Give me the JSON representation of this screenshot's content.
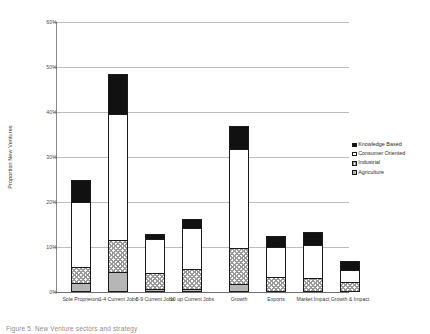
{
  "chart_data": {
    "type": "bar",
    "subtype": "stacked-column",
    "title": "",
    "xlabel": "",
    "ylabel": "Proportion New Ventures",
    "ylim": [
      0,
      60
    ],
    "ytick_labels": [
      "0%",
      "10%",
      "20%",
      "30%",
      "40%",
      "50%",
      "60%"
    ],
    "ytick_values": [
      0,
      10,
      20,
      30,
      40,
      50,
      60
    ],
    "grid": true,
    "legend_position": "right",
    "categories": [
      "Sole Proprietors",
      "1-4 Current Jobs",
      "5-9 Current Jobs",
      "10 up Current Jobs",
      "Growth",
      "Exports",
      "Market Impact",
      "Growth & Impact"
    ],
    "series": [
      {
        "name": "Agriculture",
        "key": "agriculture",
        "values": [
          2.0,
          4.5,
          0.6,
          0.6,
          1.8,
          0.0,
          0.0,
          0.0
        ]
      },
      {
        "name": "Industrial",
        "key": "industrial",
        "values": [
          3.5,
          7.0,
          3.7,
          4.5,
          8.0,
          3.4,
          3.2,
          2.2
        ]
      },
      {
        "name": "Consumer Oriented",
        "key": "consumer",
        "values": [
          14.5,
          28.0,
          7.5,
          9.2,
          22.0,
          6.6,
          7.2,
          2.6
        ]
      },
      {
        "name": "Knowledge Based",
        "key": "knowledge",
        "values": [
          5.0,
          9.0,
          1.0,
          2.0,
          5.0,
          2.4,
          3.0,
          2.0
        ]
      }
    ],
    "totals": [
      25.0,
      48.5,
      12.8,
      16.3,
      36.8,
      12.4,
      13.4,
      6.8
    ]
  },
  "legend": {
    "items": [
      {
        "label": "Knowledge Based",
        "key": "knowledge"
      },
      {
        "label": "Consumer Oriented",
        "key": "consumer"
      },
      {
        "label": "Industrial",
        "key": "industrial"
      },
      {
        "label": "Agriculture",
        "key": "agriculture"
      }
    ]
  },
  "caption": {
    "text": "Figure 5. New Venture sectors and strategy"
  }
}
